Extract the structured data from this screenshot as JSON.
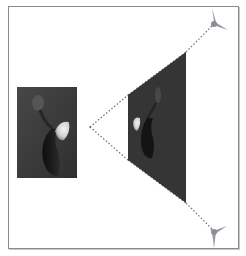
{
  "diagram": {
    "title": "Perspective projection of image",
    "colors": {
      "frame_border": "#8a8a8a",
      "photo_background": "#3c3c3c",
      "projection_fill": "#353535",
      "dotted_line": "#707070",
      "handle": "#9a9ca4",
      "petal_highlight": "#e8e8e8",
      "vase_dark": "#151515"
    },
    "source_image": {
      "label": "source photo",
      "x": 17,
      "y": 87,
      "width": 60,
      "height": 91
    },
    "vertex": {
      "label": "projection vertex",
      "x": 90,
      "y": 127
    },
    "projected_image": {
      "label": "projected photo",
      "points": [
        [
          128,
          95
        ],
        [
          186,
          52
        ],
        [
          186,
          203
        ],
        [
          128,
          160
        ]
      ]
    },
    "handles": [
      {
        "label": "top-right vanishing handle",
        "x": 214,
        "y": 24
      },
      {
        "label": "bottom-right vanishing handle",
        "x": 214,
        "y": 232
      }
    ]
  }
}
